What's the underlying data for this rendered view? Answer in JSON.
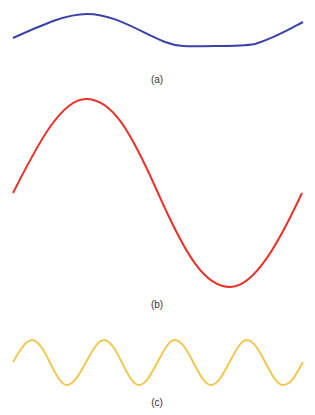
{
  "panels": [
    {
      "id": "a",
      "label": "(a)",
      "description": "low amplitude, long wavelength wave",
      "color": "#3a44a8"
    },
    {
      "id": "b",
      "label": "(b)",
      "description": "high amplitude, long wavelength wave",
      "color": "#e8332a"
    },
    {
      "id": "c",
      "label": "(c)",
      "description": "low amplitude, short wavelength wave",
      "color": "#f0c850"
    }
  ]
}
